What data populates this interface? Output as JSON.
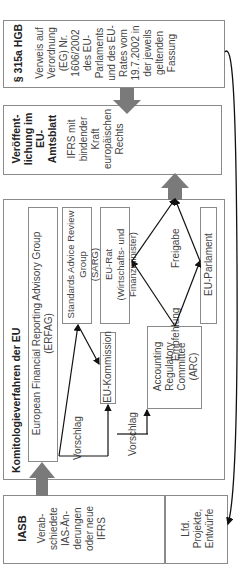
{
  "diagram": {
    "top_cut_text": "…",
    "iasb": {
      "title": "IASB",
      "text_lines": [
        "Verab-",
        "schiedete",
        "IAS-Än-",
        "derungen",
        "oder neue",
        "IFRS"
      ],
      "sub_box": [
        "Lfd.",
        "Projekte,",
        "Entwürfe"
      ]
    },
    "komitologie": {
      "title": "Komitologieverfahren der EU",
      "erfag": [
        "European Financial Reporting Advisory Group",
        "(ERFAG)"
      ],
      "sarg": [
        "Standards Advice Review Group",
        "(SARG)"
      ],
      "eu_rat": [
        "EU-Rat",
        "(Wirtschafts- und Finanzminister)"
      ],
      "eu_parlament": "EU-Parlament",
      "eu_kommission": "EU-Kommission",
      "arc": [
        "Accounting",
        "Regulatory",
        "Committee",
        "(ARC)"
      ],
      "labels": {
        "vorschlag_1": "Vorschlag",
        "vorschlag_2": "Vorschlag",
        "empfehlung": "Empfehlung",
        "freigabe": "Freigabe"
      }
    },
    "veroeffentlichung": {
      "title_lines": [
        "Veröffent-",
        "lichung im",
        "EU-",
        "Amtsblatt"
      ],
      "text_lines": [
        "IFRS mit",
        "bindender",
        "Kraft",
        "europäischen",
        "Rechts"
      ]
    },
    "hgb": {
      "title": "§ 315a HGB",
      "text_lines": [
        "Verweis auf",
        "Verordnung",
        "(EG) Nr.",
        "1606/2002",
        "des EU-",
        "Parlaments",
        "und des EU-",
        "Rates vom",
        "19.7.2002 in",
        "der jeweils",
        "geltenden",
        "Fassung"
      ]
    },
    "colors": {
      "border": "#8a8a8a",
      "arrow_fill": "#7a7a7a",
      "line": "#111111"
    }
  }
}
